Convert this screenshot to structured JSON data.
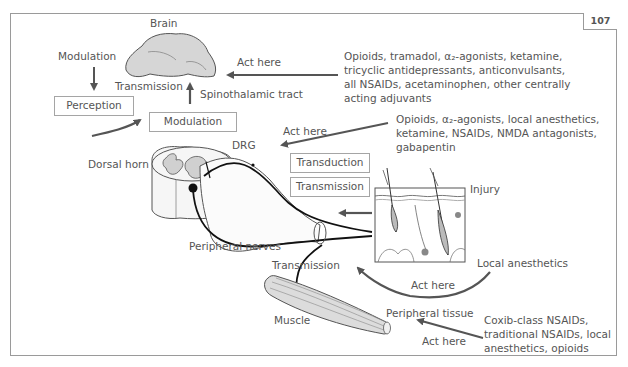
{
  "page_number": "107",
  "colors": {
    "frame": "#9a9a9a",
    "arrow": "#555555",
    "text": "#555555",
    "tissue_fill": "#d6d6d6"
  },
  "labels": {
    "brain": "Brain",
    "modulation_top": "Modulation",
    "transmission_brain": "Transmission",
    "spinothalamic": "Spinothalamic tract",
    "act_here_1": "Act here",
    "act_here_2": "Act here",
    "drg": "DRG",
    "dorsal_horn": "Dorsal horn",
    "injury": "Injury",
    "peripheral_nerves": "Peripheral nerves",
    "transmission_muscle": "Transmission",
    "muscle": "Muscle",
    "local_anesthetics": "Local anesthetics",
    "act_here_3": "Act here",
    "peripheral_tissue": "Peripheral tissue",
    "act_here_4": "Act here"
  },
  "boxes": {
    "perception": "Perception",
    "modulation": "Modulation",
    "transduction": "Transduction",
    "transmission": "Transmission"
  },
  "drug_lists": {
    "central": "Opioids, tramadol, α₂-agonists, ketamine,\ntricyclic antidepressants, anticonvulsants,\nall NSAIDs, acetaminophen, other centrally\nacting adjuvants",
    "spinal": "Opioids, α₂-agonists, local anesthetics,\nketamine, NSAIDs, NMDA antagonists,\ngabapentin",
    "peripheral": "Coxib-class NSAIDs,\ntraditional NSAIDs, local\nanesthetics, opioids"
  }
}
